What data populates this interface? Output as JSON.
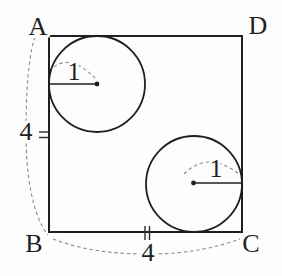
{
  "figure": {
    "type": "geometry-diagram",
    "square": {
      "corners": {
        "top_left": "A",
        "top_right": "D",
        "bottom_left": "B",
        "bottom_right": "C"
      },
      "side_labels": {
        "left": "4",
        "bottom": "4"
      }
    },
    "circles": {
      "top_left": {
        "radius_label": "1"
      },
      "bottom_right": {
        "radius_label": "1"
      }
    },
    "colors": {
      "line": "#1f1f1f",
      "dashed": "#8c8c8c",
      "background": "#fdfdfd"
    }
  }
}
